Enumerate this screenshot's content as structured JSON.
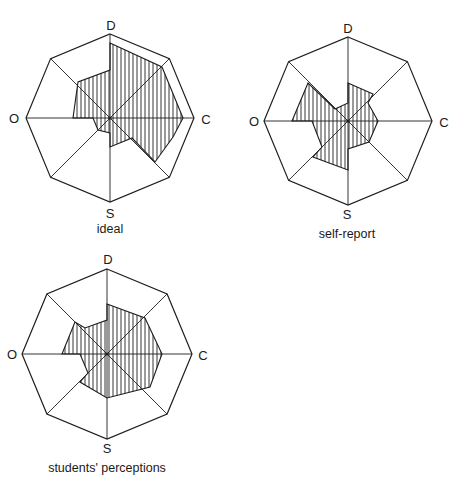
{
  "colors": {
    "ink": "#1e1e1e",
    "background": "#ffffff"
  },
  "chart_data": [
    {
      "type": "radar",
      "title": "ideal",
      "axes": [
        "D",
        "C",
        "S",
        "O"
      ],
      "spokes": 8,
      "fill": "vertical-hatch",
      "center": [
        110,
        118
      ],
      "radius": 84,
      "label_positions": {
        "D": [
          111,
          25
        ],
        "C": [
          206,
          119
        ],
        "S": [
          110,
          213
        ],
        "O": [
          14,
          118
        ]
      },
      "caption_position": [
        110,
        229
      ],
      "polygon": [
        [
          0,
          -75
        ],
        [
          52,
          -51
        ],
        [
          73,
          0
        ],
        [
          63,
          19
        ],
        [
          45,
          44
        ],
        [
          22,
          20
        ],
        [
          0,
          29
        ],
        [
          0,
          15
        ],
        [
          -12,
          12
        ],
        [
          -17,
          0
        ],
        [
          -37,
          0
        ],
        [
          -32,
          -36
        ],
        [
          0,
          -48
        ]
      ]
    },
    {
      "type": "radar",
      "title": "self-report",
      "axes": [
        "D",
        "C",
        "S",
        "O"
      ],
      "spokes": 8,
      "fill": "vertical-hatch",
      "center": [
        348,
        121
      ],
      "radius": 84,
      "label_positions": {
        "D": [
          348,
          28
        ],
        "C": [
          444,
          122
        ],
        "S": [
          347,
          214
        ],
        "O": [
          254,
          121
        ]
      },
      "caption_position": [
        347,
        234
      ],
      "polygon": [
        [
          0,
          -38
        ],
        [
          25,
          -27
        ],
        [
          20,
          -18
        ],
        [
          30,
          0
        ],
        [
          21,
          21
        ],
        [
          0,
          28
        ],
        [
          0,
          49
        ],
        [
          -35,
          36
        ],
        [
          -26,
          26
        ],
        [
          -36,
          0
        ],
        [
          -56,
          0
        ],
        [
          -40,
          -38
        ],
        [
          -13,
          -12
        ],
        [
          0,
          -18
        ]
      ]
    },
    {
      "type": "radar",
      "title": "students' perceptions",
      "axes": [
        "D",
        "C",
        "S",
        "O"
      ],
      "spokes": 8,
      "fill": "vertical-hatch",
      "center": [
        107,
        354
      ],
      "radius": 85,
      "label_positions": {
        "D": [
          108,
          259
        ],
        "C": [
          203,
          355
        ],
        "S": [
          107,
          448
        ],
        "O": [
          12,
          354
        ]
      },
      "caption_position": [
        107,
        468
      ],
      "polygon": [
        [
          0,
          -50
        ],
        [
          38,
          -36
        ],
        [
          55,
          0
        ],
        [
          43,
          33
        ],
        [
          0,
          44
        ],
        [
          -27,
          28
        ],
        [
          -19,
          19
        ],
        [
          -27,
          0
        ],
        [
          -45,
          0
        ],
        [
          -32,
          -32
        ],
        [
          -22,
          -26
        ],
        [
          0,
          -34
        ]
      ]
    }
  ]
}
